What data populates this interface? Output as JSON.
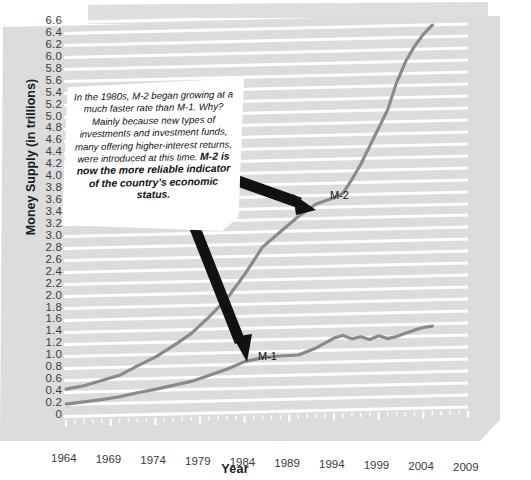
{
  "axis": {
    "y_title": "Money Supply (in trillions)",
    "x_title": "Year",
    "y_ticks": [
      "6.6",
      "6.4",
      "6.2",
      "6.0",
      "5.8",
      "5.6",
      "5.4",
      "5.2",
      "5.0",
      "4.8",
      "4.6",
      "4.4",
      "4.2",
      "4.0",
      "3.8",
      "3.6",
      "3.4",
      "3.2",
      "3.0",
      "2.8",
      "2.6",
      "2.4",
      "2.2",
      "2.0",
      "1.8",
      "1.6",
      "1.4",
      "1.2",
      "1.0",
      "0.8",
      "0.6",
      "0.4",
      "0.2",
      "0"
    ],
    "x_ticks": [
      "1964",
      "1969",
      "1974",
      "1979",
      "1984",
      "1989",
      "1994",
      "1999",
      "2004",
      "2009"
    ]
  },
  "series_labels": {
    "m1": "M-1",
    "m2": "M-2"
  },
  "callout": {
    "paragraph": "In the 1980s, M-2 began growing at a much faster rate than M-1. Why? Mainly because new types of investments and investment funds, many offering higher-interest returns, were introduced at this time. ",
    "emphasis": "M-2 is now the more reliable indicator of the country’s economic status."
  },
  "colors": {
    "paper": "#dcdcdc",
    "gridline": "#ffffff",
    "line": "#8a8a8a",
    "arrow": "#111111",
    "callout_bg": "#ffffff",
    "text": "#1c1c1c"
  },
  "chart_data": {
    "type": "line",
    "title": "",
    "xlabel": "Year",
    "ylabel": "Money Supply (in trillions)",
    "xlim": [
      1964,
      2009
    ],
    "ylim": [
      0,
      6.6
    ],
    "grid": true,
    "legend": "inline-labels",
    "x": [
      1964,
      1966,
      1968,
      1970,
      1972,
      1974,
      1976,
      1978,
      1980,
      1982,
      1984,
      1986,
      1988,
      1990,
      1992,
      1994,
      1995,
      1996,
      1997,
      1998,
      1999,
      2000,
      2001,
      2002,
      2003,
      2004,
      2005
    ],
    "series": [
      {
        "name": "M-1",
        "values": [
          0.2,
          0.23,
          0.26,
          0.3,
          0.36,
          0.41,
          0.47,
          0.53,
          0.62,
          0.72,
          0.84,
          0.9,
          0.92,
          0.93,
          1.04,
          1.2,
          1.24,
          1.18,
          1.21,
          1.16,
          1.22,
          1.17,
          1.2,
          1.25,
          1.3,
          1.34,
          1.36
        ]
      },
      {
        "name": "M-2",
        "values": [
          0.45,
          0.5,
          0.58,
          0.66,
          0.81,
          0.95,
          1.13,
          1.33,
          1.6,
          1.9,
          2.3,
          2.75,
          3.0,
          3.25,
          3.45,
          3.55,
          3.62,
          3.85,
          4.1,
          4.4,
          4.7,
          5.0,
          5.45,
          5.8,
          6.05,
          6.25,
          6.4
        ]
      }
    ],
    "annotations": [
      {
        "text": "M-2",
        "x": 1993,
        "y": 3.55
      },
      {
        "text": "M-1",
        "x": 1986,
        "y": 1.05
      }
    ]
  }
}
